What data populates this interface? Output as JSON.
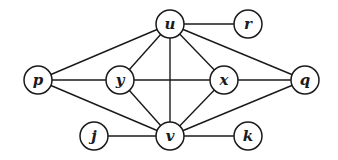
{
  "graph": {
    "nodes": [
      {
        "id": "u",
        "label": "u",
        "x": 170,
        "y": 24
      },
      {
        "id": "r",
        "label": "r",
        "x": 248,
        "y": 24
      },
      {
        "id": "p",
        "label": "p",
        "x": 38,
        "y": 80
      },
      {
        "id": "y",
        "label": "y",
        "x": 120,
        "y": 80
      },
      {
        "id": "x",
        "label": "x",
        "x": 224,
        "y": 80
      },
      {
        "id": "q",
        "label": "q",
        "x": 305,
        "y": 80
      },
      {
        "id": "j",
        "label": "j",
        "x": 94,
        "y": 136
      },
      {
        "id": "v",
        "label": "v",
        "x": 170,
        "y": 136
      },
      {
        "id": "k",
        "label": "k",
        "x": 248,
        "y": 136
      }
    ],
    "edges": [
      [
        "u",
        "r"
      ],
      [
        "u",
        "p"
      ],
      [
        "u",
        "y"
      ],
      [
        "u",
        "x"
      ],
      [
        "u",
        "q"
      ],
      [
        "u",
        "v"
      ],
      [
        "p",
        "y"
      ],
      [
        "p",
        "v"
      ],
      [
        "y",
        "x"
      ],
      [
        "y",
        "v"
      ],
      [
        "x",
        "q"
      ],
      [
        "x",
        "v"
      ],
      [
        "v",
        "q"
      ],
      [
        "j",
        "v"
      ],
      [
        "v",
        "k"
      ]
    ],
    "node_radius": 14
  }
}
